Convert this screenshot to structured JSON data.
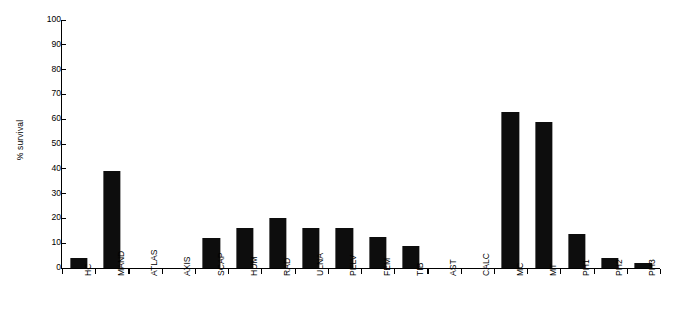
{
  "chart_data": {
    "type": "bar",
    "title": "",
    "subtitle": "",
    "xlabel": "",
    "ylabel": "% survival",
    "ylim": [
      0,
      100
    ],
    "ytick_labels": [
      "0",
      "10",
      "20",
      "30",
      "40",
      "50",
      "60",
      "70",
      "80",
      "90",
      "100"
    ],
    "ytick_values": [
      0,
      10,
      20,
      30,
      40,
      50,
      60,
      70,
      80,
      90,
      100
    ],
    "yaxis_step": 10,
    "grid": false,
    "legend": null,
    "bar_color": "#0d0d0d",
    "background_color": "#ffffff",
    "axis_color": "#000000",
    "categories": [
      "HC",
      "MAND",
      "ATLAS",
      "AXIS",
      "SCAP",
      "HUM",
      "RAD",
      "ULNA",
      "PELV",
      "FEM",
      "TIB",
      "AST",
      "CALC",
      "MC",
      "MT",
      "PH1",
      "PH2",
      "PH3"
    ],
    "values": [
      4.2,
      39,
      0,
      0,
      12.2,
      16,
      20,
      16.2,
      16.3,
      12.6,
      8.7,
      0,
      0,
      62.8,
      59,
      13.9,
      4.2,
      2.1
    ],
    "annotations": []
  }
}
